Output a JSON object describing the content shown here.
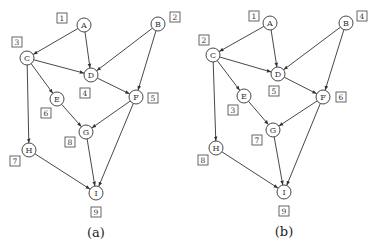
{
  "panels": [
    {
      "id": "a",
      "caption": "(a)",
      "nodes": [
        {
          "id": "A",
          "x": 84,
          "y": 25,
          "order": "1",
          "lx": 62,
          "ly": 18
        },
        {
          "id": "B",
          "x": 158,
          "y": 24,
          "order": "2",
          "lx": 175,
          "ly": 17
        },
        {
          "id": "C",
          "x": 27,
          "y": 58,
          "order": "3",
          "lx": 17,
          "ly": 42
        },
        {
          "id": "D",
          "x": 91,
          "y": 75,
          "order": "4",
          "lx": 85,
          "ly": 93
        },
        {
          "id": "E",
          "x": 57,
          "y": 99,
          "order": "6",
          "lx": 46,
          "ly": 113
        },
        {
          "id": "F",
          "x": 136,
          "y": 97,
          "order": "5",
          "lx": 153,
          "ly": 98
        },
        {
          "id": "G",
          "x": 86,
          "y": 132,
          "order": "8",
          "lx": 70,
          "ly": 142
        },
        {
          "id": "H",
          "x": 29,
          "y": 150,
          "order": "7",
          "lx": 15,
          "ly": 161
        },
        {
          "id": "I",
          "x": 96,
          "y": 193,
          "order": "9",
          "lx": 96,
          "ly": 212
        }
      ],
      "caption_x": 96,
      "caption_y": 232
    },
    {
      "id": "b",
      "caption": "(b)",
      "nodes": [
        {
          "id": "A",
          "x": 270,
          "y": 23,
          "order": "1",
          "lx": 254,
          "ly": 16
        },
        {
          "id": "B",
          "x": 346,
          "y": 23,
          "order": "4",
          "lx": 362,
          "ly": 16
        },
        {
          "id": "C",
          "x": 213,
          "y": 55,
          "order": "2",
          "lx": 204,
          "ly": 40
        },
        {
          "id": "D",
          "x": 278,
          "y": 74,
          "order": "5",
          "lx": 274,
          "ly": 91
        },
        {
          "id": "E",
          "x": 244,
          "y": 96,
          "order": "3",
          "lx": 233,
          "ly": 110
        },
        {
          "id": "F",
          "x": 323,
          "y": 97,
          "order": "6",
          "lx": 341,
          "ly": 97
        },
        {
          "id": "G",
          "x": 273,
          "y": 130,
          "order": "7",
          "lx": 257,
          "ly": 140
        },
        {
          "id": "H",
          "x": 216,
          "y": 148,
          "order": "8",
          "lx": 203,
          "ly": 160
        },
        {
          "id": "I",
          "x": 284,
          "y": 192,
          "order": "9",
          "lx": 284,
          "ly": 211
        }
      ],
      "caption_x": 284,
      "caption_y": 231
    }
  ],
  "edges": [
    [
      "A",
      "C"
    ],
    [
      "A",
      "D"
    ],
    [
      "B",
      "D"
    ],
    [
      "B",
      "F"
    ],
    [
      "C",
      "D"
    ],
    [
      "C",
      "E"
    ],
    [
      "C",
      "H"
    ],
    [
      "D",
      "F"
    ],
    [
      "E",
      "G"
    ],
    [
      "F",
      "G"
    ],
    [
      "F",
      "I"
    ],
    [
      "G",
      "I"
    ],
    [
      "H",
      "I"
    ]
  ],
  "style": {
    "node_radius": 7,
    "stroke": "#333333",
    "background": "#ffffff"
  }
}
